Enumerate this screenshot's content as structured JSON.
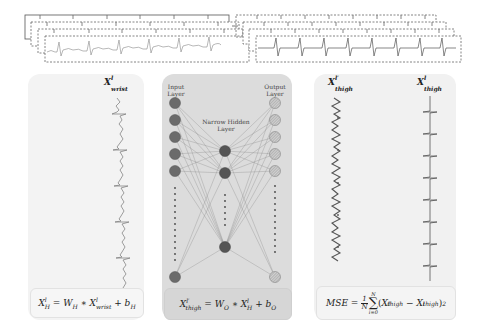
{
  "top_signals": {
    "left_stack": {
      "frames": 4,
      "style": "dashed",
      "top_frame_style": "solid",
      "signal": "ecg-wrist",
      "beats_per_frame": 6
    },
    "right_stack": {
      "frames": 4,
      "style": "dashed",
      "signal": "ecg-thigh",
      "beats_per_frame": 9
    }
  },
  "panels": {
    "left": {
      "signal_label": {
        "base": "X",
        "sup": "l",
        "sub": "wrist"
      },
      "equation": {
        "lhs_base": "X",
        "lhs_sup": "l",
        "lhs_sub": "H",
        "eq": " = ",
        "w": "W",
        "w_sub": "H",
        "op": " ∗ ",
        "x": "X",
        "x_sup": "l",
        "x_sub": "wrist",
        "plus": " + ",
        "b": "b",
        "b_sub": "H"
      }
    },
    "middle": {
      "input_layer_label": "Input\nLayer",
      "hidden_layer_label": "Narrow Hidden\nLayer",
      "output_layer_label": "Output\nLayer",
      "input_nodes_visible": 6,
      "hidden_nodes_visible": 3,
      "output_nodes_visible": 6,
      "equation": {
        "lhs_base": "X",
        "lhs_sup": "l′",
        "lhs_sub": "thigh",
        "eq": " = ",
        "w": "W",
        "w_sub": "O",
        "op": " ∗ ",
        "x": "X",
        "x_sup": "l",
        "x_sub": "H",
        "plus": " + ",
        "b": "b",
        "b_sub": "O"
      }
    },
    "right": {
      "reconstructed_label": {
        "base": "X",
        "sup": "l′",
        "sub": "thigh"
      },
      "target_label": {
        "base": "X",
        "sup": "l",
        "sub": "thigh"
      },
      "equation": {
        "lhs": "MSE",
        "eq": " = ",
        "frac_num": "1",
        "frac_den": "N",
        "sum_top": "N",
        "sum_bottom": "i=0",
        "sum_symbol": "∑",
        "term1_base": "X",
        "term1_sup": "l′",
        "term1_sub": "thigh",
        "minus": " − ",
        "term2_base": "X",
        "term2_sup": "l",
        "term2_sub": "thigh",
        "power": "2"
      }
    }
  },
  "colors": {
    "panel_left": "#f3f3f3",
    "panel_mid": "#dcdcdc",
    "panel_right": "#f1f1f1",
    "node_dark": "#5a5a5a",
    "node_hatched": "#bdbdbd",
    "line": "#777777"
  }
}
